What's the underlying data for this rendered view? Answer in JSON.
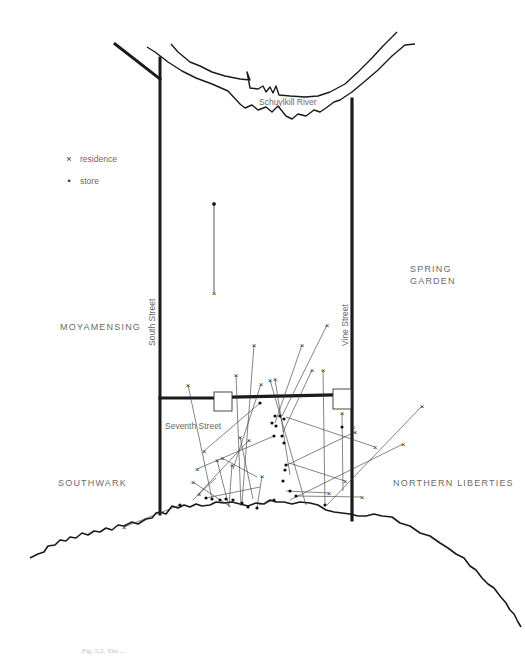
{
  "map": {
    "river_label": "Schuylkill River",
    "districts": {
      "moyamensing": "MOYAMENSING",
      "spring_garden_line1": "SPRING",
      "spring_garden_line2": "GARDEN",
      "southwark": "SOUTHWARK",
      "northern_liberties": "NORTHERN LIBERTIES"
    },
    "streets": {
      "south": "South Street",
      "vine": "Vine Street",
      "seventh": "Seventh Street"
    },
    "legend": [
      {
        "symbol": "×",
        "icon": "residence-cross-icon",
        "label": "residence"
      },
      {
        "symbol": "•",
        "icon": "store-dot-icon",
        "label": "store"
      }
    ],
    "caption": "Fig. 5.2. The ...",
    "colors": {
      "ink": "#1a1a1a",
      "label": "#6a6a6a",
      "background": "#ffffff"
    }
  }
}
